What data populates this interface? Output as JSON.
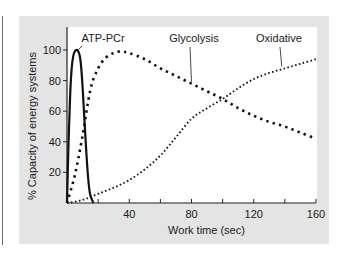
{
  "chart_data": {
    "type": "line",
    "title": "",
    "xlabel": "Work time (sec)",
    "ylabel": "% Capacity of energy systems",
    "xlim": [
      0,
      160
    ],
    "ylim": [
      0,
      115
    ],
    "grid": false,
    "legend": "inline labels with leader lines",
    "x_ticks": [
      0,
      20,
      40,
      60,
      80,
      100,
      120,
      140,
      160
    ],
    "x_tick_labels": [
      "40",
      "80",
      "120",
      "160"
    ],
    "x_tick_label_values": [
      40,
      80,
      120,
      160
    ],
    "y_ticks": [
      20,
      40,
      60,
      80,
      100
    ],
    "y_tick_labels": [
      "20",
      "40",
      "60",
      "80",
      "100"
    ],
    "series": [
      {
        "name": "ATP-PCr",
        "style": "solid",
        "x": [
          0,
          1,
          2,
          3,
          4,
          5,
          6.5,
          8,
          9,
          10,
          11,
          12,
          13,
          14,
          15,
          17
        ],
        "y": [
          0,
          40,
          70,
          88,
          96,
          99,
          100,
          97,
          90,
          76,
          58,
          40,
          24,
          12,
          5,
          0
        ]
      },
      {
        "name": "Glycolysis",
        "style": "dashed",
        "x": [
          0,
          5,
          10,
          15,
          20,
          25,
          30,
          34,
          40,
          50,
          60,
          70,
          80,
          90,
          100,
          110,
          120,
          130,
          140,
          150,
          160
        ],
        "y": [
          0,
          18,
          44,
          74,
          88,
          95,
          98,
          99,
          98,
          94,
          88,
          83,
          78,
          73,
          68,
          62,
          57,
          53,
          50,
          46,
          42
        ]
      },
      {
        "name": "Oxidative",
        "style": "dotted",
        "x": [
          0,
          10,
          20,
          30,
          40,
          50,
          60,
          70,
          80,
          90,
          100,
          110,
          120,
          130,
          140,
          150,
          160
        ],
        "y": [
          0,
          2,
          6,
          10,
          15,
          22,
          31,
          43,
          55,
          62,
          68,
          75,
          81,
          85,
          88,
          91,
          94
        ]
      }
    ],
    "annotations": [
      {
        "text": "ATP-PCr",
        "points_to": {
          "x": 6.5,
          "y": 100
        }
      },
      {
        "text": "Glycolysis",
        "points_to": {
          "x": 80,
          "y": 78
        }
      },
      {
        "text": "Oxidative",
        "points_to": {
          "x": 138,
          "y": 88
        }
      }
    ]
  }
}
